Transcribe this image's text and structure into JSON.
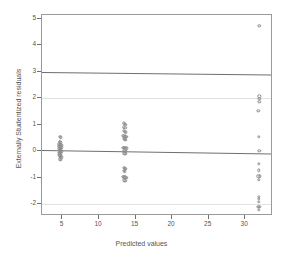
{
  "chart_data": {
    "type": "scatter",
    "title": "",
    "xlabel": "Predicted values",
    "ylabel": "Externally Studentized residuals",
    "xlim": [
      2.2,
      33.8
    ],
    "ylim": [
      -2.45,
      5.15
    ],
    "xticks": [
      5,
      10,
      15,
      20,
      25,
      30
    ],
    "yticks": [
      5,
      4,
      3,
      2,
      1,
      0,
      -1,
      -2
    ],
    "grid": "horizontal-faint",
    "legend": "none",
    "marker": "open-circle",
    "marker_color": "#8c8c8c",
    "reference_lines": [
      {
        "name": "upper-bound-line",
        "y_left": 3.0,
        "y_right": 2.9,
        "style": "solid",
        "color": "#6f6f6f"
      },
      {
        "name": "zero-line",
        "y_left": 0.05,
        "y_right": -0.08,
        "style": "solid",
        "color": "#6f6f6f"
      }
    ],
    "gridlines": [
      {
        "name": "gridline-2",
        "y": 2.0,
        "color": "#e2e2e2"
      },
      {
        "name": "gridline-minus-2",
        "y": -2.0,
        "color": "#e2e2e2"
      }
    ],
    "clusters": [
      {
        "name": "cluster-low",
        "x": 4.7,
        "n": 26
      },
      {
        "name": "cluster-mid",
        "x": 13.5,
        "n": 30
      },
      {
        "name": "cluster-high",
        "x": 32.0,
        "n": 18
      }
    ],
    "points": [
      {
        "x": 4.62,
        "y": 0.55
      },
      {
        "x": 4.78,
        "y": 0.52
      },
      {
        "x": 4.6,
        "y": 0.36
      },
      {
        "x": 4.72,
        "y": 0.33
      },
      {
        "x": 4.55,
        "y": 0.26
      },
      {
        "x": 4.68,
        "y": 0.24
      },
      {
        "x": 4.82,
        "y": 0.22
      },
      {
        "x": 4.58,
        "y": 0.18
      },
      {
        "x": 4.7,
        "y": 0.16
      },
      {
        "x": 4.84,
        "y": 0.15
      },
      {
        "x": 4.52,
        "y": 0.1
      },
      {
        "x": 4.65,
        "y": 0.09
      },
      {
        "x": 4.76,
        "y": 0.08
      },
      {
        "x": 4.6,
        "y": 0.02
      },
      {
        "x": 4.73,
        "y": 0.01
      },
      {
        "x": 4.86,
        "y": 0.0
      },
      {
        "x": 4.54,
        "y": -0.06
      },
      {
        "x": 4.67,
        "y": -0.07
      },
      {
        "x": 4.8,
        "y": -0.08
      },
      {
        "x": 4.58,
        "y": -0.14
      },
      {
        "x": 4.71,
        "y": -0.15
      },
      {
        "x": 4.62,
        "y": -0.21
      },
      {
        "x": 4.75,
        "y": -0.22
      },
      {
        "x": 4.88,
        "y": -0.23
      },
      {
        "x": 4.65,
        "y": -0.3
      },
      {
        "x": 4.79,
        "y": -0.32
      },
      {
        "x": 13.4,
        "y": 1.05
      },
      {
        "x": 13.56,
        "y": 1.03
      },
      {
        "x": 13.68,
        "y": 1.0
      },
      {
        "x": 13.42,
        "y": 0.9
      },
      {
        "x": 13.58,
        "y": 0.88
      },
      {
        "x": 13.38,
        "y": 0.76
      },
      {
        "x": 13.52,
        "y": 0.74
      },
      {
        "x": 13.66,
        "y": 0.72
      },
      {
        "x": 13.3,
        "y": 0.58
      },
      {
        "x": 13.46,
        "y": 0.56
      },
      {
        "x": 13.6,
        "y": 0.55
      },
      {
        "x": 13.74,
        "y": 0.54
      },
      {
        "x": 13.36,
        "y": 0.46
      },
      {
        "x": 13.5,
        "y": 0.45
      },
      {
        "x": 13.64,
        "y": 0.44
      },
      {
        "x": 13.34,
        "y": 0.14
      },
      {
        "x": 13.48,
        "y": 0.13
      },
      {
        "x": 13.62,
        "y": 0.12
      },
      {
        "x": 13.76,
        "y": 0.11
      },
      {
        "x": 13.44,
        "y": 0.02
      },
      {
        "x": 13.58,
        "y": 0.0
      },
      {
        "x": 13.46,
        "y": -0.08
      },
      {
        "x": 13.6,
        "y": -0.1
      },
      {
        "x": 13.42,
        "y": -0.62
      },
      {
        "x": 13.56,
        "y": -0.64
      },
      {
        "x": 13.7,
        "y": -0.66
      },
      {
        "x": 13.38,
        "y": -0.74
      },
      {
        "x": 13.52,
        "y": -0.76
      },
      {
        "x": 13.34,
        "y": -0.96
      },
      {
        "x": 13.48,
        "y": -0.98
      },
      {
        "x": 13.62,
        "y": -0.99
      },
      {
        "x": 13.76,
        "y": -1.0
      },
      {
        "x": 13.44,
        "y": -1.1
      },
      {
        "x": 13.58,
        "y": -1.12
      },
      {
        "x": 31.95,
        "y": 4.75
      },
      {
        "x": 31.9,
        "y": 2.08
      },
      {
        "x": 31.9,
        "y": 1.97
      },
      {
        "x": 31.9,
        "y": 1.86
      },
      {
        "x": 31.8,
        "y": 1.52
      },
      {
        "x": 31.88,
        "y": 0.55
      },
      {
        "x": 31.92,
        "y": 0.02
      },
      {
        "x": 31.86,
        "y": -0.48
      },
      {
        "x": 31.84,
        "y": -0.72
      },
      {
        "x": 31.78,
        "y": -0.95
      },
      {
        "x": 31.96,
        "y": -0.95
      },
      {
        "x": 31.88,
        "y": -1.08
      },
      {
        "x": 31.86,
        "y": -1.72
      },
      {
        "x": 31.86,
        "y": -1.8
      },
      {
        "x": 31.88,
        "y": -1.92
      },
      {
        "x": 31.8,
        "y": -2.1
      },
      {
        "x": 31.94,
        "y": -2.1
      },
      {
        "x": 31.88,
        "y": -2.22
      }
    ]
  }
}
